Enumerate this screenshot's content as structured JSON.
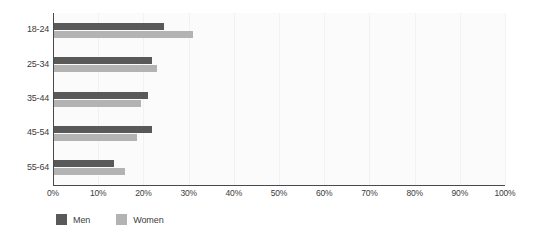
{
  "chart_data": {
    "type": "bar",
    "orientation": "horizontal",
    "title": "",
    "xlabel": "",
    "ylabel": "",
    "categories": [
      "18-24",
      "25-34",
      "35-44",
      "45-54",
      "55-64"
    ],
    "series": [
      {
        "name": "Men",
        "color": "#595959",
        "values": [
          24.5,
          22.0,
          21.0,
          22.0,
          13.5
        ]
      },
      {
        "name": "Women",
        "color": "#b3b3b3",
        "values": [
          31.0,
          23.0,
          19.5,
          18.5,
          16.0
        ]
      }
    ],
    "xlim": [
      0,
      100
    ],
    "xticks": [
      0,
      10,
      20,
      30,
      40,
      50,
      60,
      70,
      80,
      90,
      100
    ],
    "xtick_labels": [
      "0%",
      "10%",
      "20%",
      "30%",
      "40%",
      "50%",
      "60%",
      "70%",
      "80%",
      "90%",
      "100%"
    ],
    "grid": true,
    "grid_axis": "x",
    "legend_position": "bottom-left",
    "value_suffix": "%"
  },
  "legend": {
    "items": [
      {
        "label": "Men",
        "swatch": "men-swatch"
      },
      {
        "label": "Women",
        "swatch": "women-swatch"
      }
    ]
  },
  "colors": {
    "men": "#595959",
    "women": "#b3b3b3",
    "axis": "#4a4a4a",
    "gridline": "#f2f2f2",
    "plot_background": "#fbfbfb",
    "page_background": "#ffffff",
    "text": "#3d3d3d"
  }
}
